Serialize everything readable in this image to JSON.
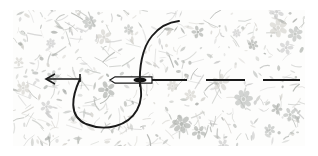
{
  "figure": {
    "type": "instructional-line-drawing",
    "canvas": {
      "width": 318,
      "height": 156
    },
    "background_color": "#ffffff",
    "ink_color": "#1a1a1a"
  },
  "fabric": {
    "name": "floral printed fabric swatch",
    "bounds": {
      "x": 13,
      "y": 10,
      "width": 292,
      "height": 136
    },
    "base_color": "#fdfdfc",
    "motif_colors": [
      "#c9c9c9",
      "#b9bcb8",
      "#d3d1cc",
      "#a9aca8"
    ],
    "motif_opacity": 0.85,
    "motif_count": 520,
    "flower_count": 26,
    "description": "dense light grey tossed floral print with small leaves and sprigs"
  },
  "stitch_line": {
    "baseline_y": 80,
    "description": "horizontal stitching line running left to right across the fabric"
  },
  "direction_arrow": {
    "name": "thread-direction-arrow",
    "points": "left",
    "shaft_start_x": 80,
    "shaft_end_x": 46,
    "y": 79,
    "head_length": 9,
    "head_spread": 5,
    "stroke_width": 1.6
  },
  "needle": {
    "name": "sewing-needle",
    "tip_x": 110,
    "eye_end_x": 152,
    "y": 80,
    "body_half_height": 3.2,
    "eye": {
      "center_x": 140,
      "center_y": 80,
      "rx": 6.5,
      "ry": 2.6,
      "fill": "#111111"
    },
    "stroke_width": 1.2,
    "fill": "#ffffff",
    "description": "needle shown in profile piercing the fabric, eye threaded"
  },
  "thread": {
    "name": "working-thread",
    "stroke_width": 1.9,
    "loop_path": "M 80 79 C 72 96 68 116 86 124 C 106 132 128 126 137 110 C 143 99 141 90 140 82",
    "tail_path": "M 140 86 C 139 68 142 48 152 36 C 160 26 170 22 179 21",
    "tail_end": {
      "x": 179,
      "y": 21
    },
    "description": "slack loop of thread dipping below the stitch line, then rising up to the right"
  },
  "stitches": {
    "name": "completed-running-stitches",
    "stroke_width": 1.8,
    "y": 80,
    "dashes": [
      {
        "x1": 152,
        "x2": 187
      },
      {
        "x1": 206,
        "x2": 245
      },
      {
        "x1": 263,
        "x2": 300
      }
    ],
    "count": 3,
    "description": "evenly spaced completed stitch dashes to the right of the needle"
  }
}
